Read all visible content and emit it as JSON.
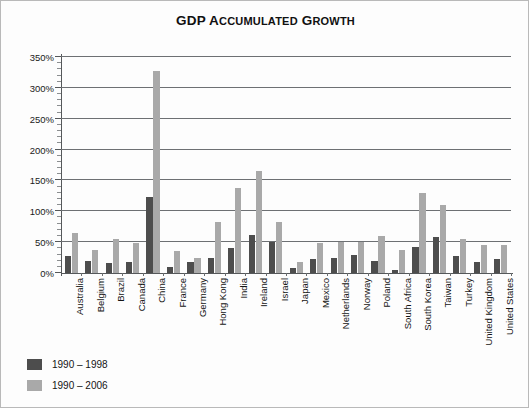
{
  "chart_data": {
    "type": "bar",
    "title": "GDP Accumulated Growth",
    "xlabel": "",
    "ylabel": "",
    "ylim": [
      0,
      350
    ],
    "ytick_step": 50,
    "ytick_labels": [
      "0%",
      "50%",
      "100%",
      "150%",
      "200%",
      "250%",
      "300%",
      "350%"
    ],
    "ytick_values": [
      0,
      50,
      100,
      150,
      200,
      250,
      300,
      350
    ],
    "minor_ticks": true,
    "grid": true,
    "legend_position": "bottom-left",
    "categories": [
      "Australia",
      "Belgium",
      "Brazil",
      "Canada",
      "China",
      "France",
      "Germany",
      "Hong Kong",
      "India",
      "Ireland",
      "Israel",
      "Japan",
      "Mexico",
      "Netherlands",
      "Norway",
      "Poland",
      "South Africa",
      "South Korea",
      "Taiwan",
      "Turkey",
      "United Kingdom",
      "United States"
    ],
    "series": [
      {
        "name": "1990 – 1998",
        "color": "#4d4d4d",
        "values": [
          28,
          20,
          17,
          18,
          123,
          10,
          18,
          25,
          40,
          62,
          50,
          8,
          22,
          25,
          30,
          20,
          5,
          42,
          58,
          28,
          18,
          22
        ]
      },
      {
        "name": "1990 – 2006",
        "color": "#a9a9a9",
        "values": [
          65,
          38,
          55,
          48,
          327,
          35,
          24,
          82,
          137,
          165,
          82,
          18,
          48,
          50,
          50,
          60,
          38,
          130,
          110,
          55,
          45,
          45
        ]
      }
    ]
  },
  "legend": {
    "items": [
      {
        "label": "1990 – 1998",
        "color": "#4d4d4d"
      },
      {
        "label": "1990 – 2006",
        "color": "#a9a9a9"
      }
    ]
  }
}
